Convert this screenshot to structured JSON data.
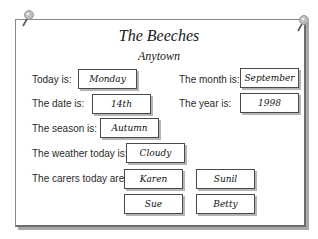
{
  "header": {
    "title": "The Beeches",
    "subtitle": "Anytown"
  },
  "fields": {
    "day": {
      "label": "Today is:",
      "value": "Monday"
    },
    "month": {
      "label": "The month is:",
      "value": "September"
    },
    "date": {
      "label": "The date is:",
      "value": "14th"
    },
    "year": {
      "label": "The year is:",
      "value": "1998"
    },
    "season": {
      "label": "The season is:",
      "value": "Autumn"
    },
    "weather": {
      "label": "The weather today is:",
      "value": "Cloudy"
    }
  },
  "carers": {
    "label": "The carers today are:",
    "names": [
      "Karen",
      "Sunil",
      "Sue",
      "Betty"
    ]
  },
  "icons": {
    "pin_left": "push-pin",
    "pin_right": "push-pin"
  },
  "colors": {
    "board_border": "#6e6e6e",
    "box_border": "#4a4a4a",
    "pin_head": "#b0b0b0"
  }
}
